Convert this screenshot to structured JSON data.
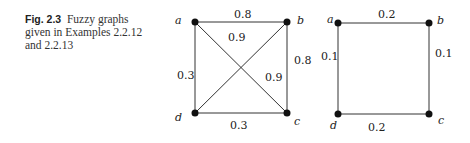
{
  "caption": {
    "figure_number": "Fig. 2.3",
    "text": "Fuzzy graphs given in Examples 2.2.12 and 2.2.13"
  },
  "graph1": {
    "nodes": [
      {
        "id": "a",
        "label": "a",
        "x": 195,
        "y": 22
      },
      {
        "id": "b",
        "label": "b",
        "x": 287,
        "y": 22
      },
      {
        "id": "c",
        "label": "c",
        "x": 287,
        "y": 113
      },
      {
        "id": "d",
        "label": "d",
        "x": 195,
        "y": 113
      }
    ],
    "edges": [
      {
        "from": "a",
        "to": "b",
        "weight": "0.8"
      },
      {
        "from": "b",
        "to": "c",
        "weight": "0.8"
      },
      {
        "from": "c",
        "to": "d",
        "weight": "0.3"
      },
      {
        "from": "d",
        "to": "a",
        "weight": "0.3"
      },
      {
        "from": "a",
        "to": "c",
        "weight": "0.9"
      },
      {
        "from": "b",
        "to": "d",
        "weight": "0.9"
      }
    ]
  },
  "graph2": {
    "nodes": [
      {
        "id": "a",
        "label": "a",
        "x": 338,
        "y": 23
      },
      {
        "id": "b",
        "label": "b",
        "x": 429,
        "y": 23
      },
      {
        "id": "c",
        "label": "c",
        "x": 429,
        "y": 114
      },
      {
        "id": "d",
        "label": "d",
        "x": 338,
        "y": 114
      }
    ],
    "edges": [
      {
        "from": "a",
        "to": "b",
        "weight": "0.2"
      },
      {
        "from": "b",
        "to": "c",
        "weight": "0.1"
      },
      {
        "from": "c",
        "to": "d",
        "weight": "0.2"
      },
      {
        "from": "d",
        "to": "a",
        "weight": "0.1"
      }
    ]
  }
}
